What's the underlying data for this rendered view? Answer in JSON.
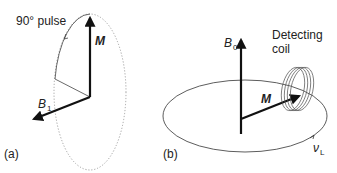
{
  "panel_a": {
    "label": "(a)",
    "pulse_label": "90° pulse",
    "vector_m": "M",
    "vector_b1": "B",
    "vector_b1_sub": "1"
  },
  "panel_b": {
    "label": "(b)",
    "vector_b0": "B",
    "vector_b0_sub": "0",
    "vector_m": "M",
    "coil_label_line1": "Detecting",
    "coil_label_line2": "coil",
    "larmor": "ν",
    "larmor_sub": "L"
  }
}
